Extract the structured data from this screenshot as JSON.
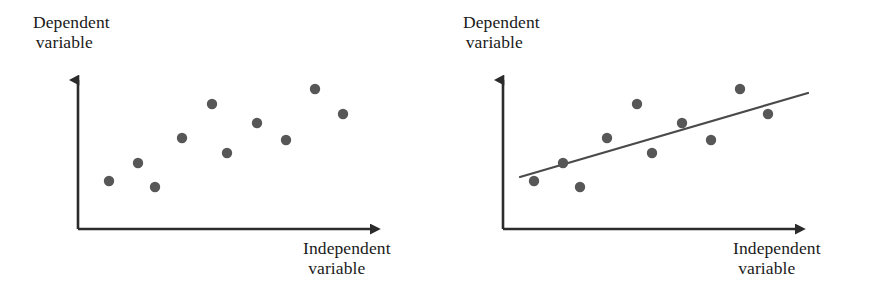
{
  "figure": {
    "width": 889,
    "height": 301,
    "background": "#ffffff",
    "panels": [
      {
        "id": "scatter-no-line",
        "position": "left",
        "y_axis_label_line1": "Dependent",
        "y_axis_label_line2": "variable",
        "x_axis_label_line1": "Independent",
        "x_axis_label_line2": "variable",
        "has_regression_line": false
      },
      {
        "id": "scatter-with-line",
        "position": "right",
        "y_axis_label_line1": "Dependent",
        "y_axis_label_line2": "variable",
        "x_axis_label_line1": "Independent",
        "x_axis_label_line2": "variable",
        "has_regression_line": true
      }
    ]
  },
  "style": {
    "axis_color": "#2b2b2b",
    "point_color": "#575757",
    "line_color": "#4a4a4a",
    "text_color": "#1a1a1a",
    "point_radius": 5.2,
    "axis_stroke_width": 2.6,
    "regression_stroke_width": 2.2
  },
  "chart_data": [
    {
      "type": "scatter",
      "title": "",
      "xlabel": "Independent variable",
      "ylabel": "Dependent variable",
      "grid": false,
      "legend": "none",
      "axis_origin_px": [
        78,
        229
      ],
      "x_axis_end_px": [
        380,
        229
      ],
      "y_axis_top_px": [
        78,
        72
      ],
      "xlim": [
        0,
        1
      ],
      "ylim": [
        0,
        1
      ],
      "points_px": [
        [
          109,
          181
        ],
        [
          138,
          163
        ],
        [
          155,
          187
        ],
        [
          182,
          138
        ],
        [
          212,
          104
        ],
        [
          227,
          153
        ],
        [
          257,
          123
        ],
        [
          286,
          140
        ],
        [
          315,
          89
        ],
        [
          343,
          114
        ]
      ],
      "points_normalized": [
        [
          0.103,
          0.306
        ],
        [
          0.199,
          0.42
        ],
        [
          0.255,
          0.268
        ],
        [
          0.344,
          0.58
        ],
        [
          0.444,
          0.796
        ],
        [
          0.493,
          0.484
        ],
        [
          0.593,
          0.675
        ],
        [
          0.689,
          0.567
        ],
        [
          0.785,
          0.892
        ],
        [
          0.877,
          0.732
        ]
      ],
      "regression_line": null
    },
    {
      "type": "scatter",
      "title": "",
      "xlabel": "Independent variable",
      "ylabel": "Dependent variable",
      "grid": false,
      "legend": "none",
      "axis_origin_px": [
        59,
        229
      ],
      "x_axis_end_px": [
        361,
        229
      ],
      "y_axis_top_px": [
        59,
        72
      ],
      "xlim": [
        0,
        1
      ],
      "ylim": [
        0,
        1
      ],
      "points_px": [
        [
          90,
          181
        ],
        [
          119,
          163
        ],
        [
          136,
          187
        ],
        [
          163,
          138
        ],
        [
          193,
          104
        ],
        [
          208,
          153
        ],
        [
          238,
          123
        ],
        [
          267,
          140
        ],
        [
          296,
          89
        ],
        [
          324,
          114
        ]
      ],
      "points_normalized": [
        [
          0.103,
          0.306
        ],
        [
          0.199,
          0.42
        ],
        [
          0.255,
          0.268
        ],
        [
          0.344,
          0.58
        ],
        [
          0.444,
          0.796
        ],
        [
          0.493,
          0.484
        ],
        [
          0.593,
          0.675
        ],
        [
          0.689,
          0.567
        ],
        [
          0.785,
          0.892
        ],
        [
          0.877,
          0.732
        ]
      ],
      "regression_line": {
        "x1_px": 76,
        "y1_px": 177,
        "x2_px": 364,
        "y2_px": 93,
        "slope_px": -0.2917,
        "description": "best-fit trend line, positive slope"
      }
    }
  ]
}
